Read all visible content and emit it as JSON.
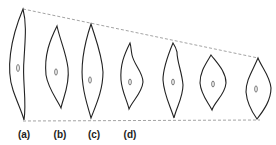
{
  "diagram": {
    "labels": [
      {
        "id": "a",
        "text": "(a)"
      },
      {
        "id": "b",
        "text": "(b)"
      },
      {
        "id": "c",
        "text": "(c)"
      },
      {
        "id": "d",
        "text": "(d)"
      }
    ],
    "cells_count": 7,
    "colors": {
      "outline": "#222222",
      "dashed_line": "#999999",
      "background": "#ffffff"
    }
  }
}
